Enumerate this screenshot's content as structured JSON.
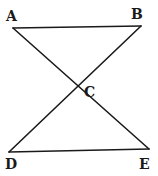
{
  "diagram": {
    "type": "geometry",
    "points": {
      "A": {
        "label": "A",
        "x": 13,
        "y": 28
      },
      "B": {
        "label": "B",
        "x": 141,
        "y": 26
      },
      "C": {
        "label": "C",
        "x": 77,
        "y": 90
      },
      "D": {
        "label": "D",
        "x": 9,
        "y": 152
      },
      "E": {
        "label": "E",
        "x": 149,
        "y": 149
      }
    },
    "segments": [
      [
        "A",
        "B"
      ],
      [
        "A",
        "E"
      ],
      [
        "B",
        "D"
      ],
      [
        "D",
        "E"
      ]
    ],
    "colors": {
      "stroke": "#1a1a1a",
      "background": "#ffffff"
    }
  }
}
